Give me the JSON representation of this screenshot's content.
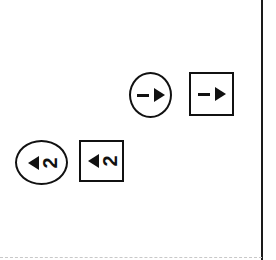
{
  "diagram": {
    "markers": [
      {
        "shape": "circle",
        "label": "1",
        "direction": "right",
        "icon": "triangle-right-icon"
      },
      {
        "shape": "square",
        "label": "1",
        "direction": "right",
        "icon": "triangle-right-icon"
      },
      {
        "shape": "circle",
        "label": "2",
        "direction": "left",
        "icon": "triangle-left-icon"
      },
      {
        "shape": "square",
        "label": "2",
        "direction": "left",
        "icon": "triangle-left-icon"
      }
    ]
  },
  "colors": {
    "ink": "#111111",
    "background": "#ffffff",
    "dashed_edge": "#c8c8c8"
  }
}
